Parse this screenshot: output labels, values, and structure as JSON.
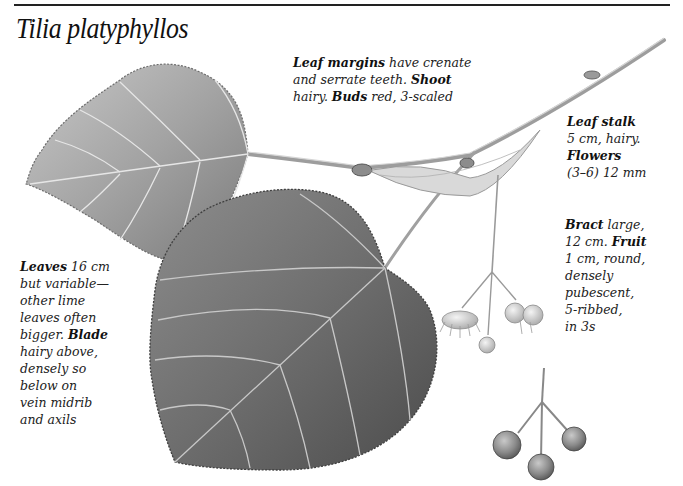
{
  "page": {
    "title": "Tilia platyphyllos"
  },
  "notes": {
    "margins": {
      "lines": [
        {
          "bold": "Leaf margins",
          "text": " have crenate"
        },
        {
          "bold": "",
          "text": "and serrate teeth. ",
          "bold2": "Shoot"
        },
        {
          "bold": "",
          "text": "hairy. ",
          "bold2": "Buds",
          "text2": " red, 3-scaled"
        }
      ]
    },
    "leafstalk": {
      "lines": [
        {
          "bold": "Leaf stalk",
          "text": ""
        },
        {
          "bold": "",
          "text": "5 cm, hairy."
        },
        {
          "bold": "Flowers",
          "text": ""
        },
        {
          "bold": "",
          "text": "(3–6) 12 mm"
        }
      ]
    },
    "bract": {
      "lines": [
        {
          "bold": "Bract",
          "text": " large,"
        },
        {
          "bold": "",
          "text": "12 cm. ",
          "bold2": "Fruit"
        },
        {
          "bold": "",
          "text": "1 cm, round,"
        },
        {
          "bold": "",
          "text": "densely"
        },
        {
          "bold": "",
          "text": "pubescent,"
        },
        {
          "bold": "",
          "text": "5-ribbed,"
        },
        {
          "bold": "",
          "text": "in 3s"
        }
      ]
    },
    "leaves": {
      "lines": [
        {
          "bold": "Leaves",
          "text": " 16 cm"
        },
        {
          "bold": "",
          "text": "but variable—"
        },
        {
          "bold": "",
          "text": "other lime"
        },
        {
          "bold": "",
          "text": "leaves often"
        },
        {
          "bold": "",
          "text": "bigger. ",
          "bold2": "Blade"
        },
        {
          "bold": "",
          "text": "hairy above,"
        },
        {
          "bold": "",
          "text": "densely so"
        },
        {
          "bold": "",
          "text": "below on"
        },
        {
          "bold": "",
          "text": "vein midrib"
        },
        {
          "bold": "",
          "text": "and axils"
        }
      ]
    }
  },
  "illustration": {
    "subjects": [
      "upper-leaf",
      "lower-leaf",
      "shoot",
      "bract",
      "flower-cluster",
      "fruit-cluster"
    ],
    "colors": {
      "leaf_light": "#b8b8b8",
      "leaf_mid": "#8f8f8f",
      "leaf_dark": "#5a5a5a",
      "vein": "#e4e4e4",
      "stem": "#a8a8a8",
      "fruit": "#8a8a8a"
    }
  }
}
